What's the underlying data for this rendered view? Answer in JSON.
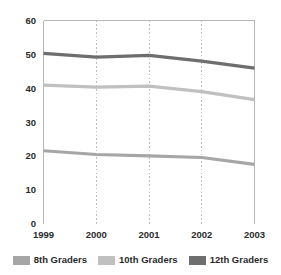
{
  "chart_data": {
    "type": "line",
    "title": "",
    "xlabel": "",
    "ylabel": "",
    "x": [
      "1999",
      "2000",
      "2001",
      "2002",
      "2003"
    ],
    "categories": [
      "1999",
      "2000",
      "2001",
      "2002",
      "2003"
    ],
    "xtick_labels": [
      "1999",
      "2000",
      "2001",
      "2002",
      "2003"
    ],
    "ytick_labels": [
      "0",
      "10",
      "20",
      "30",
      "40",
      "50",
      "60"
    ],
    "yticks": [
      0,
      10,
      20,
      30,
      40,
      50,
      60
    ],
    "ylim": [
      0,
      60
    ],
    "grid": "vertical-dotted",
    "legend_position": "bottom",
    "series": [
      {
        "name": "8th Graders",
        "color": "#a6a6a6",
        "values": [
          21.5,
          20.4,
          20.0,
          19.5,
          17.5
        ]
      },
      {
        "name": "10th Graders",
        "color": "#c0c0c0",
        "values": [
          40.9,
          40.3,
          40.6,
          39.0,
          36.6
        ]
      },
      {
        "name": "12th Graders",
        "color": "#6e6e6e",
        "values": [
          50.3,
          49.2,
          49.7,
          48.0,
          45.9
        ]
      }
    ]
  },
  "legend": {
    "items": [
      {
        "label": "8th Graders",
        "color": "#a6a6a6"
      },
      {
        "label": "10th Graders",
        "color": "#c0c0c0"
      },
      {
        "label": "12th Graders",
        "color": "#6e6e6e"
      }
    ]
  },
  "colors": {
    "background": "#ffffff",
    "frame": "#b8b8b8",
    "gridline": "#bdbdbd",
    "text": "#2b2b2b",
    "series_8th": "#a6a6a6",
    "series_10th": "#c0c0c0",
    "series_12th": "#6e6e6e"
  }
}
